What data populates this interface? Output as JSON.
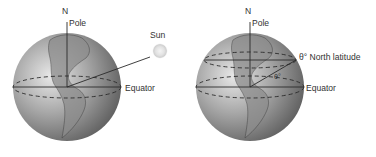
{
  "figure": {
    "left_panel": {
      "north_label": "N",
      "pole_label": "Pole",
      "sun_label": "Sun",
      "equator_label": "Equator"
    },
    "right_panel": {
      "north_label": "N",
      "pole_label": "Pole",
      "latitude_label": "θ° North latitude",
      "angle_label": "θ°",
      "equator_label": "Equator"
    }
  }
}
